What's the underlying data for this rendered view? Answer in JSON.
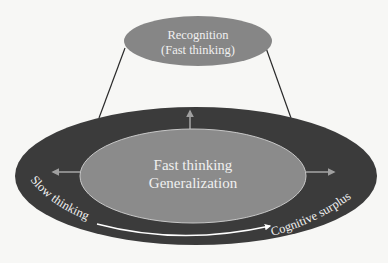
{
  "diagram": {
    "top_node": {
      "line1": "Recognition",
      "line2": "(Fast thinking)"
    },
    "center_node": {
      "line1": "Fast thinking",
      "line2": "Generalization"
    },
    "outer_ring": {
      "left_label": "Slow thinking",
      "right_label": "Cognitive surplus"
    },
    "colors": {
      "background": "#f7f7f5",
      "outer_ellipse": "#3b3b3b",
      "inner_ellipse": "#8b8b8b",
      "top_ellipse": "#868686",
      "arrow": "#9a9a9a",
      "text": "#f0f0f0",
      "connector_line": "#2a2a2a"
    }
  }
}
